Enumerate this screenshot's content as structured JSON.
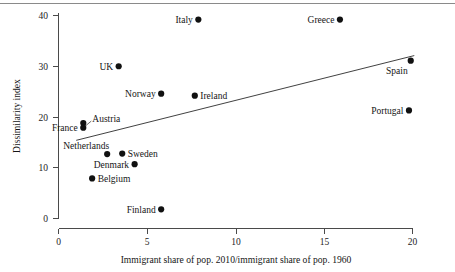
{
  "figure": {
    "has_top_rule": true,
    "background": "#ffffff",
    "point_color": "#111111",
    "axis_color": "#4a4a4a"
  },
  "chart_data": {
    "type": "scatter",
    "title": "",
    "xlabel": "Immigrant share of pop. 2010/immigrant share of pop. 1960",
    "ylabel": "Dissimilarity index",
    "xlim": [
      0,
      21.5
    ],
    "ylim": [
      0,
      41.5
    ],
    "xticks": [
      0,
      5,
      10,
      15,
      20
    ],
    "xtick_labels": [
      "0",
      "5",
      "10",
      "15",
      "20"
    ],
    "yticks": [
      0,
      10,
      20,
      30,
      40
    ],
    "ytick_labels": [
      "0",
      "10",
      "20",
      "30",
      "40"
    ],
    "grid": false,
    "legend": "none",
    "points": [
      {
        "label": "Italy",
        "x": 7.9,
        "y": 39.2,
        "label_pos": "left"
      },
      {
        "label": "Greece",
        "x": 15.9,
        "y": 39.2,
        "label_pos": "left"
      },
      {
        "label": "UK",
        "x": 3.4,
        "y": 30.0,
        "label_pos": "left"
      },
      {
        "label": "Spain",
        "x": 19.9,
        "y": 31.1,
        "label_pos": "below-left"
      },
      {
        "label": "Norway",
        "x": 5.8,
        "y": 24.6,
        "label_pos": "left"
      },
      {
        "label": "Ireland",
        "x": 7.7,
        "y": 24.2,
        "label_pos": "right"
      },
      {
        "label": "Portugal",
        "x": 19.8,
        "y": 21.3,
        "label_pos": "left"
      },
      {
        "label": "Austria",
        "x": 1.4,
        "y": 18.8,
        "label_pos": "right-offset"
      },
      {
        "label": "France",
        "x": 1.4,
        "y": 17.9,
        "label_pos": "left"
      },
      {
        "label": "Netherlands",
        "x": 2.75,
        "y": 12.7,
        "label_pos": "above-left"
      },
      {
        "label": "Sweden",
        "x": 3.6,
        "y": 12.8,
        "label_pos": "right"
      },
      {
        "label": "Denmark",
        "x": 4.3,
        "y": 10.7,
        "label_pos": "left"
      },
      {
        "label": "Belgium",
        "x": 1.9,
        "y": 7.9,
        "label_pos": "right"
      },
      {
        "label": "Finland",
        "x": 5.8,
        "y": 1.8,
        "label_pos": "left"
      }
    ],
    "trend_line": {
      "x0": 1.0,
      "y0": 15.4,
      "x1": 20.1,
      "y1": 32.1
    }
  }
}
